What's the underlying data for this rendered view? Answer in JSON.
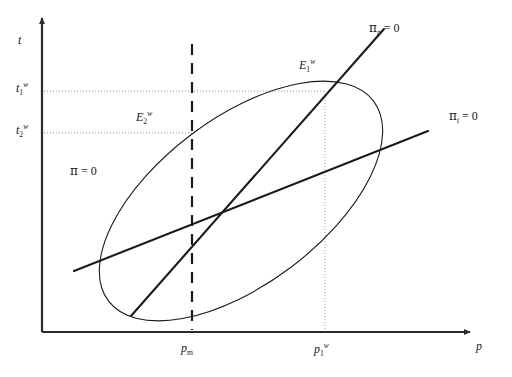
{
  "figure": {
    "kind": "phase-diagram",
    "background_color": "#ffffff",
    "line_color": "#1a1a1a",
    "guide_color": "#8a8a8a"
  },
  "axes": {
    "y": {
      "name": "y-axis",
      "label": "t",
      "label_text": "t"
    },
    "x": {
      "name": "x-axis",
      "label": "p",
      "label_text": "p"
    },
    "origin_px": [
      42,
      332
    ],
    "y_top_px": 18,
    "x_right_px": 470
  },
  "ticks": {
    "y": [
      {
        "id": "t1w",
        "base": "t",
        "sup": "w",
        "sub": "1",
        "y_px": 91
      },
      {
        "id": "t2w",
        "base": "t",
        "sup": "w",
        "sub": "2",
        "y_px": 133
      }
    ],
    "x": [
      {
        "id": "pm",
        "base": "p",
        "sup": "",
        "sub": "m",
        "x_px": 192
      },
      {
        "id": "p1w",
        "base": "p",
        "sup": "w",
        "sub": "1",
        "x_px": 325
      }
    ]
  },
  "curves": {
    "isoprofit": {
      "name": "pi-equals-zero-ellipse",
      "label_base": "π",
      "label_sub": "",
      "label_rhs": " = 0",
      "label_text": "π = 0",
      "label_pos_px": [
        70,
        165
      ],
      "center_px": [
        241,
        201
      ],
      "rx_px": 166,
      "ry_px": 83,
      "rotation_deg": -37
    },
    "pi_p": {
      "name": "pi-p-equals-zero-locus",
      "label_base": "π",
      "label_sub": "p",
      "label_rhs": " = 0",
      "label_text": "πp = 0",
      "label_pos_px": [
        369,
        22
      ],
      "from_px": [
        131,
        316
      ],
      "to_px": [
        384,
        29
      ]
    },
    "pi_t": {
      "name": "pi-t-equals-zero-locus",
      "label_base": "π",
      "label_sub": "t",
      "label_rhs": " = 0",
      "label_text": "πt = 0",
      "label_pos_px": [
        449,
        110
      ],
      "from_px": [
        74,
        271
      ],
      "to_px": [
        428,
        131
      ]
    }
  },
  "equilibria": [
    {
      "id": "E1w",
      "base": "E",
      "sup": "w",
      "sub": "1",
      "point_px": [
        325,
        91
      ],
      "label_pos_px": [
        299,
        58
      ]
    },
    {
      "id": "E2w",
      "base": "E",
      "sup": "w",
      "sub": "2",
      "point_px": [
        192,
        133
      ],
      "label_pos_px": [
        136,
        110
      ]
    }
  ],
  "guides": {
    "dashed_vertical": {
      "name": "pm-dashed-line",
      "x_px": 192,
      "y_top_px": 44,
      "y_bottom_px": 330
    },
    "dotted_vertical": {
      "name": "p1w-dotted-line",
      "x_px": 325,
      "y_top_px": 91,
      "y_bottom_px": 330
    },
    "dotted_horizontals": [
      {
        "name": "t1w-dotted-line",
        "y_px": 91,
        "x_left_px": 44,
        "x_right_px": 325
      },
      {
        "name": "t2w-dotted-line",
        "y_px": 133,
        "x_left_px": 44,
        "x_right_px": 192
      }
    ]
  }
}
